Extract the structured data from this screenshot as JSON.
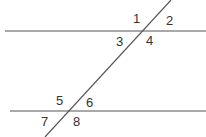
{
  "diagram": {
    "title": "",
    "line_color": "#555555",
    "label_color": "#333333",
    "lines": {
      "top_parallel": {
        "x1": 5,
        "y1": 31,
        "x2": 206,
        "y2": 31
      },
      "bottom_parallel": {
        "x1": 10,
        "y1": 111,
        "x2": 206,
        "y2": 111
      },
      "transversal": {
        "x1": 45,
        "y1": 137,
        "x2": 171,
        "y2": 0
      }
    },
    "angles": [
      {
        "id": "1",
        "label": "1",
        "x": 133,
        "y": 23
      },
      {
        "id": "2",
        "label": "2",
        "x": 166,
        "y": 25
      },
      {
        "id": "3",
        "label": "3",
        "x": 116,
        "y": 46
      },
      {
        "id": "4",
        "label": "4",
        "x": 146,
        "y": 45
      },
      {
        "id": "5",
        "label": "5",
        "x": 56,
        "y": 105
      },
      {
        "id": "6",
        "label": "6",
        "x": 86,
        "y": 107
      },
      {
        "id": "7",
        "label": "7",
        "x": 41,
        "y": 126
      },
      {
        "id": "8",
        "label": "8",
        "x": 73,
        "y": 126
      }
    ]
  }
}
